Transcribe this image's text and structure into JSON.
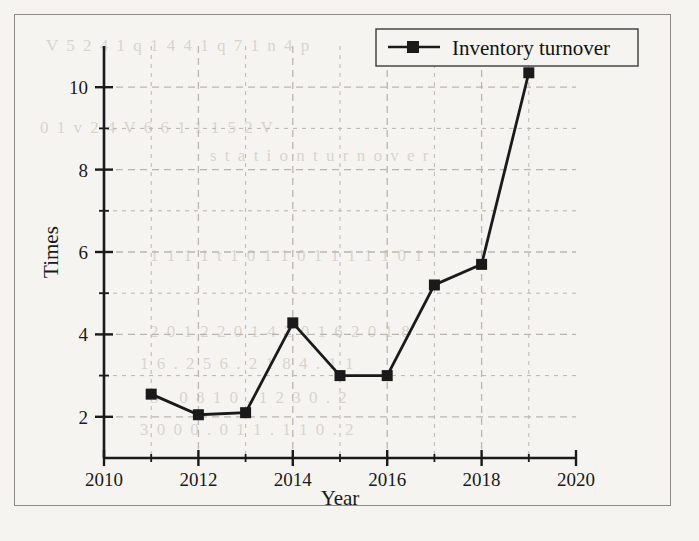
{
  "figure": {
    "background_color": "#f6f4f1",
    "frame_color": "#8f8c88",
    "series_color": "#1a1a1a",
    "grid_color": "#b9b6b1"
  },
  "legend": {
    "position": "top-right",
    "entries": [
      {
        "label": "Inventory turnover",
        "marker": "filled-square",
        "color": "#1a1a1a"
      }
    ]
  },
  "axes": {
    "x": {
      "title": "Year",
      "ticks": [
        "2010",
        "2012",
        "2014",
        "2016",
        "2018",
        "2020"
      ],
      "min": 2010,
      "max": 2020
    },
    "y": {
      "title": "Times",
      "ticks": [
        "2",
        "4",
        "6",
        "8",
        "10"
      ],
      "min": 1,
      "max": 11
    }
  },
  "chart_data": {
    "type": "line",
    "title": "",
    "xlabel": "Year",
    "ylabel": "Times",
    "xlim": [
      2010,
      2020
    ],
    "ylim": [
      1,
      11
    ],
    "grid": true,
    "legend_position": "top-right",
    "xtick_labels": [
      "2010",
      "2012",
      "2014",
      "2016",
      "2018",
      "2020"
    ],
    "ytick_labels": [
      "2",
      "4",
      "6",
      "8",
      "10"
    ],
    "x": [
      2011,
      2012,
      2013,
      2014,
      2015,
      2016,
      2017,
      2018,
      2019
    ],
    "series": [
      {
        "name": "Inventory turnover",
        "marker": "square",
        "color": "#1a1a1a",
        "values": [
          2.55,
          2.05,
          2.1,
          4.28,
          3.0,
          3.0,
          5.2,
          5.7,
          10.35
        ]
      }
    ]
  },
  "bleed_text": {
    "lines": [
      "V 5 2 4 1 q 1 4 4 1 q 7 1 n 4 p",
      "0 1 v 2 4 V 6 6 1 1 1 5 2 V",
      "s t a t i o n   t u r n o v e r",
      "1 1 1 1 t 1 0 1 1 0 1 1 1 1 1 0 1",
      "2 0 1 2   2 0 1 4   2 0 1 6   2 0 1 8",
      "1 6 . 2 5   6 . 2 1 8   4 . 1 1",
      "5 . 0 8   1 0 . 1 2   3 0 . 2",
      "3 0 0   0 . 0 1   1 . 1   1 0 . 2"
    ]
  }
}
